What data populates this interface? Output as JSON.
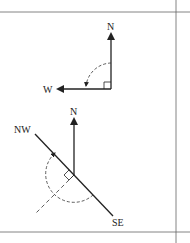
{
  "diagram": {
    "top": {
      "labels": {
        "north": "N",
        "west": "W"
      },
      "description": "North vector rotated 90° counterclockwise to West"
    },
    "bottom": {
      "labels": {
        "north": "N",
        "northwest": "NW",
        "southeast": "SE"
      },
      "description": "North vector with perpendicular NW–SE line and dashed rotation arc"
    },
    "colors": {
      "stroke": "#222222",
      "frame": "#555555",
      "background": "#ffffff"
    }
  }
}
